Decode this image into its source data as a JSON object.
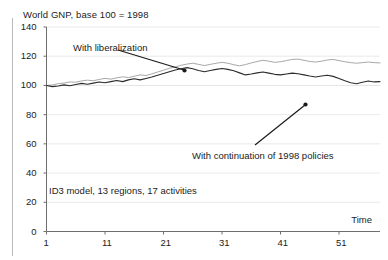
{
  "figure": {
    "title": "World GNP, base 100 = 1998",
    "axis_time_label": "Time",
    "caption": "ID3 model, 13 regions, 17 activities"
  },
  "annotations": {
    "liberalization": "With liberalization",
    "continuation": "With continuation of 1998 policies"
  },
  "colors": {
    "series_liberalization": "#a8a8a8",
    "series_continuation": "#2b2b2b",
    "axis": "#6e6e6e",
    "grid": "#e4e4e4",
    "text": "#222222",
    "border": "#b9b9b9"
  },
  "yticks": [
    "0",
    "20",
    "40",
    "60",
    "80",
    "100",
    "120",
    "140"
  ],
  "xticks": [
    "1",
    "11",
    "21",
    "31",
    "41",
    "51"
  ],
  "chart_data": {
    "type": "line",
    "title": "World GNP, base 100 = 1998",
    "subtitle": "ID3 model, 13 regions, 17 activities",
    "xlabel": "Time",
    "ylabel": "",
    "xlim": [
      1,
      58
    ],
    "ylim": [
      0,
      140
    ],
    "ytick_values": [
      0,
      20,
      40,
      60,
      80,
      100,
      120,
      140
    ],
    "xtick_values": [
      1,
      11,
      21,
      31,
      41,
      51
    ],
    "grid": true,
    "grid_axis": "y",
    "legend": "none (inline annotations)",
    "x": [
      1,
      2,
      3,
      4,
      5,
      6,
      7,
      8,
      9,
      10,
      11,
      12,
      13,
      14,
      15,
      16,
      17,
      18,
      19,
      20,
      21,
      22,
      23,
      24,
      25,
      26,
      27,
      28,
      29,
      30,
      31,
      32,
      33,
      34,
      35,
      36,
      37,
      38,
      39,
      40,
      41,
      42,
      43,
      44,
      45,
      46,
      47,
      48,
      49,
      50,
      51,
      52,
      53,
      54,
      55,
      56,
      57,
      58
    ],
    "series": [
      {
        "name": "With liberalization",
        "color": "#a8a8a8",
        "values": [
          100.0,
          100.3,
          101.2,
          101.6,
          102.4,
          102.2,
          103.1,
          103.6,
          103.2,
          104.1,
          104.8,
          104.3,
          105.2,
          105.9,
          105.4,
          106.3,
          107.2,
          106.8,
          107.9,
          109.2,
          110.4,
          111.8,
          112.6,
          113.8,
          114.6,
          115.2,
          114.4,
          113.6,
          114.4,
          115.2,
          115.8,
          115.2,
          114.2,
          113.4,
          114.3,
          115.4,
          116.4,
          117.2,
          116.6,
          115.8,
          116.2,
          117.0,
          117.8,
          118.0,
          117.2,
          116.4,
          116.0,
          116.6,
          117.4,
          117.8,
          117.0,
          116.2,
          115.6,
          115.2,
          115.6,
          116.0,
          115.6,
          115.4
        ]
      },
      {
        "name": "With continuation of 1998 policies",
        "color": "#2b2b2b",
        "values": [
          100.0,
          99.2,
          99.6,
          100.4,
          99.8,
          100.6,
          101.4,
          100.8,
          101.6,
          102.4,
          101.8,
          102.6,
          103.4,
          102.6,
          103.8,
          104.6,
          103.8,
          104.8,
          105.8,
          107.0,
          108.2,
          109.4,
          110.6,
          111.4,
          112.2,
          111.4,
          110.2,
          109.4,
          110.2,
          111.0,
          111.6,
          111.0,
          110.0,
          108.6,
          107.2,
          107.8,
          108.6,
          109.2,
          108.4,
          107.6,
          107.2,
          107.8,
          108.4,
          108.0,
          107.2,
          106.4,
          105.8,
          106.4,
          107.0,
          106.2,
          104.8,
          103.2,
          101.8,
          101.2,
          102.2,
          103.0,
          102.4,
          102.6
        ]
      }
    ],
    "annotations": [
      {
        "text": "With liberalization",
        "points_to_series": "With liberalization",
        "points_to_x": 20
      },
      {
        "text": "With continuation of 1998 policies",
        "points_to_series": "With continuation of 1998 policies",
        "points_to_x": 51
      }
    ]
  }
}
